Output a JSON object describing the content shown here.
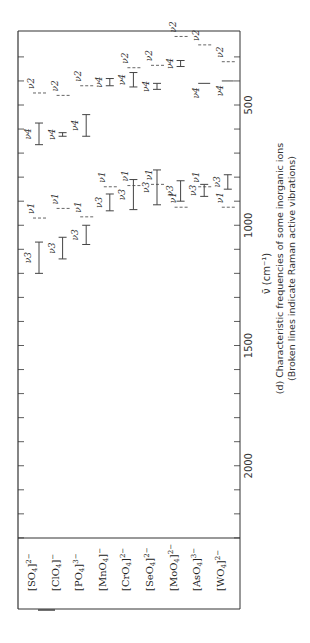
{
  "chart_data": {
    "type": "range",
    "title": "(d) Characteristic frequencies of some inorganic ions",
    "subtitle": "(Broken lines indicate Raman active vibrations)",
    "xlabel": "ν̄ (cm⁻¹)",
    "ylabel": "",
    "xlim": [
      200,
      2500
    ],
    "x_ticks": [
      500,
      1000,
      1500,
      2000
    ],
    "orientation": "rotated 90° (frequency axis runs top-to-bottom on page)",
    "categories": [
      "[SO4]2−",
      "[ClO4]−",
      "[PO4]3−",
      "[MnO4]−",
      "[CrO4]2−",
      "[SeO4]2−",
      "[MoO4]2−",
      "[AsO4]3−",
      "[WO4]2−"
    ],
    "category_labels": [
      {
        "base": "[SO",
        "sub": "4",
        "rest": "]",
        "sup": "2−"
      },
      {
        "base": "[ClO",
        "sub": "4",
        "rest": "]",
        "sup": "−"
      },
      {
        "base": "[PO",
        "sub": "4",
        "rest": "]",
        "sup": "3−"
      },
      {
        "base": "[MnO",
        "sub": "4",
        "rest": "]",
        "sup": "−"
      },
      {
        "base": "[CrO",
        "sub": "4",
        "rest": "]",
        "sup": "2−"
      },
      {
        "base": "[SeO",
        "sub": "4",
        "rest": "]",
        "sup": "2−"
      },
      {
        "base": "[MoO",
        "sub": "4",
        "rest": "]",
        "sup": "2−"
      },
      {
        "base": "[AsO",
        "sub": "4",
        "rest": "]",
        "sup": "3−"
      },
      {
        "base": "[WO",
        "sub": "4",
        "rest": "]",
        "sup": "2−"
      }
    ],
    "series": [
      {
        "ion": "[SO4]2−",
        "bands": [
          {
            "mode": "ν2",
            "style": "broken",
            "value": 450
          },
          {
            "mode": "ν4",
            "style": "range",
            "min": 575,
            "max": 665
          },
          {
            "mode": "ν1",
            "style": "broken",
            "value": 970
          },
          {
            "mode": "ν3",
            "style": "range",
            "min": 1070,
            "max": 1200
          }
        ]
      },
      {
        "ion": "[ClO4]−",
        "bands": [
          {
            "mode": "ν2",
            "style": "broken",
            "value": 460
          },
          {
            "mode": "ν4",
            "style": "range",
            "min": 615,
            "max": 630
          },
          {
            "mode": "ν1",
            "style": "broken",
            "value": 930
          },
          {
            "mode": "ν3",
            "style": "range",
            "min": 1050,
            "max": 1140
          }
        ]
      },
      {
        "ion": "[PO4]3−",
        "bands": [
          {
            "mode": "ν2",
            "style": "broken",
            "value": 420
          },
          {
            "mode": "ν4",
            "style": "range",
            "min": 540,
            "max": 630
          },
          {
            "mode": "ν1",
            "style": "broken",
            "value": 965
          },
          {
            "mode": "ν3",
            "style": "range",
            "min": 1000,
            "max": 1080
          }
        ]
      },
      {
        "ion": "[MnO4]−",
        "bands": [
          {
            "mode": "ν4",
            "style": "range",
            "min": 390,
            "max": 420
          },
          {
            "mode": "ν1",
            "style": "broken",
            "value": 840
          },
          {
            "mode": "ν3",
            "style": "range",
            "min": 870,
            "max": 940
          }
        ]
      },
      {
        "ion": "[CrO4]2−",
        "bands": [
          {
            "mode": "ν2",
            "style": "broken",
            "value": 345
          },
          {
            "mode": "ν4",
            "style": "range",
            "min": 365,
            "max": 425
          },
          {
            "mode": "ν1",
            "style": "broken",
            "value": 835
          },
          {
            "mode": "ν3",
            "style": "range",
            "min": 810,
            "max": 935
          }
        ]
      },
      {
        "ion": "[SeO4]2−",
        "bands": [
          {
            "mode": "ν2",
            "style": "broken",
            "value": 335
          },
          {
            "mode": "ν4",
            "style": "range",
            "min": 410,
            "max": 435
          },
          {
            "mode": "ν1",
            "style": "broken",
            "value": 830
          },
          {
            "mode": "ν3",
            "style": "range",
            "min": 770,
            "max": 915
          }
        ]
      },
      {
        "ion": "[MoO4]2−",
        "bands": [
          {
            "mode": "ν2",
            "style": "broken",
            "value": 215
          },
          {
            "mode": "ν4",
            "style": "range",
            "min": 315,
            "max": 340
          },
          {
            "mode": "ν1",
            "style": "broken",
            "value": 925
          },
          {
            "mode": "ν3",
            "style": "range",
            "min": 815,
            "max": 900
          }
        ]
      },
      {
        "ion": "[AsO4]3−",
        "bands": [
          {
            "mode": "ν2",
            "style": "broken",
            "value": 250
          },
          {
            "mode": "ν4",
            "style": "solid",
            "value": 410
          },
          {
            "mode": "ν1",
            "style": "broken",
            "value": 840
          },
          {
            "mode": "ν3",
            "style": "range",
            "min": 830,
            "max": 880
          }
        ]
      },
      {
        "ion": "[WO4]2−",
        "bands": [
          {
            "mode": "ν2",
            "style": "broken",
            "value": 320
          },
          {
            "mode": "ν4",
            "style": "solid",
            "value": 400
          },
          {
            "mode": "ν1",
            "style": "broken",
            "value": 925
          },
          {
            "mode": "ν3",
            "style": "range",
            "min": 790,
            "max": 850
          }
        ]
      }
    ]
  }
}
